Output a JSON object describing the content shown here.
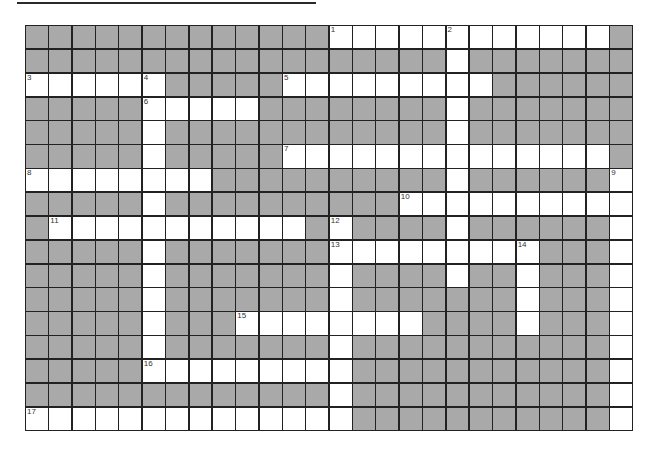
{
  "puzzle": {
    "type": "crossword",
    "cols": 26,
    "rows": 17,
    "colors": {
      "block": "#a9a9a9",
      "open": "#ffffff",
      "line": "#222222"
    },
    "open_cells": [
      [
        0,
        [
          13,
          14,
          15,
          16,
          17,
          18,
          19,
          20,
          21,
          22,
          23,
          24
        ]
      ],
      [
        1,
        [
          18
        ]
      ],
      [
        2,
        [
          0,
          1,
          2,
          3,
          4,
          5,
          11,
          12,
          13,
          14,
          15,
          16,
          17,
          18,
          19
        ]
      ],
      [
        3,
        [
          5,
          6,
          7,
          8,
          9,
          18
        ]
      ],
      [
        4,
        [
          5,
          18
        ]
      ],
      [
        5,
        [
          5,
          11,
          12,
          13,
          14,
          15,
          16,
          17,
          18,
          19,
          20,
          21,
          22,
          23,
          24
        ]
      ],
      [
        6,
        [
          0,
          1,
          2,
          3,
          4,
          5,
          6,
          7,
          18,
          25
        ]
      ],
      [
        7,
        [
          5,
          16,
          17,
          18,
          19,
          20,
          21,
          22,
          23,
          24,
          25
        ]
      ],
      [
        8,
        [
          1,
          2,
          3,
          4,
          5,
          6,
          7,
          8,
          9,
          10,
          11,
          13,
          18,
          25
        ]
      ],
      [
        9,
        [
          5,
          13,
          14,
          15,
          16,
          17,
          18,
          19,
          20,
          21,
          25
        ]
      ],
      [
        10,
        [
          5,
          13,
          18,
          21,
          25
        ]
      ],
      [
        11,
        [
          5,
          13,
          21,
          25
        ]
      ],
      [
        12,
        [
          5,
          9,
          10,
          11,
          12,
          13,
          14,
          15,
          16,
          21,
          25
        ]
      ],
      [
        13,
        [
          5,
          13,
          25
        ]
      ],
      [
        14,
        [
          5,
          6,
          7,
          8,
          9,
          10,
          11,
          12,
          13,
          25
        ]
      ],
      [
        15,
        [
          13,
          25
        ]
      ],
      [
        16,
        [
          0,
          1,
          2,
          3,
          4,
          5,
          6,
          7,
          8,
          9,
          10,
          11,
          12,
          13,
          25
        ]
      ]
    ],
    "clue_numbers": [
      {
        "n": "1",
        "r": 0,
        "c": 13
      },
      {
        "n": "2",
        "r": 0,
        "c": 18
      },
      {
        "n": "3",
        "r": 2,
        "c": 0
      },
      {
        "n": "4",
        "r": 2,
        "c": 5
      },
      {
        "n": "5",
        "r": 2,
        "c": 11
      },
      {
        "n": "6",
        "r": 3,
        "c": 5
      },
      {
        "n": "7",
        "r": 5,
        "c": 11
      },
      {
        "n": "8",
        "r": 6,
        "c": 0
      },
      {
        "n": "9",
        "r": 6,
        "c": 25
      },
      {
        "n": "10",
        "r": 7,
        "c": 16
      },
      {
        "n": "11",
        "r": 8,
        "c": 1
      },
      {
        "n": "12",
        "r": 8,
        "c": 13
      },
      {
        "n": "13",
        "r": 9,
        "c": 13
      },
      {
        "n": "14",
        "r": 9,
        "c": 21
      },
      {
        "n": "15",
        "r": 12,
        "c": 9
      },
      {
        "n": "16",
        "r": 14,
        "c": 5
      },
      {
        "n": "17",
        "r": 16,
        "c": 0
      }
    ]
  }
}
